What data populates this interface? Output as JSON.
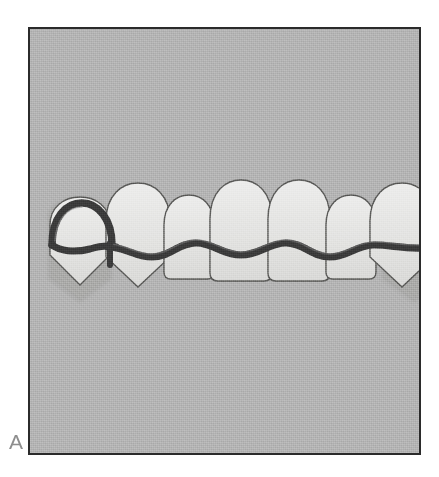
{
  "figure": {
    "label": "A",
    "caption_letter": "A",
    "domain": "dental-illustration"
  },
  "canvas": {
    "width": 439,
    "height": 477,
    "background_color": "#ffffff"
  },
  "panel": {
    "x": 28,
    "y": 27,
    "width": 393,
    "height": 428,
    "fill_color": "#b2b2b2",
    "border_color": "#2b2b2b",
    "border_width": 2
  },
  "colors": {
    "background_gray": "#b2b2b2",
    "panel_border": "#2b2b2b",
    "tooth_fill": "#e2e2e0",
    "tooth_outline": "#4a4a4a",
    "tooth_shadow": "#c7c7c5",
    "wire_dark": "#3a3a3a",
    "wire_highlight": "#6f6f6f",
    "label_gray": "#8e8e8e"
  },
  "illustration": {
    "type": "dental-arch-frontal",
    "tooth_count": 8,
    "arch": "maxillary-anterior",
    "appliance": {
      "name": "hawley-retainer",
      "labial_bow_present": true,
      "labial_bow_color": "#3a3a3a",
      "clasp_count": 2,
      "clasp_positions": [
        "left-canine",
        "right-canine"
      ],
      "clasp_shape": "circumferential-loop"
    },
    "teeth": [
      {
        "index": 1,
        "name": "canine-right",
        "shape": "pointed",
        "cx": 78,
        "top": 213,
        "bottom": 288,
        "half_width": 32,
        "crown_height": 56
      },
      {
        "index": 2,
        "name": "lateral-incisor-right",
        "shape": "pointed",
        "cx": 132,
        "top": 205,
        "bottom": 290,
        "half_width": 31,
        "crown_height": 64
      },
      {
        "index": 3,
        "name": "central-incisor-right",
        "shape": "flat",
        "cx": 182,
        "top": 215,
        "bottom": 281,
        "half_width": 26,
        "crown_height": 52
      },
      {
        "index": 4,
        "name": "central-incisor-mid-r",
        "shape": "flat",
        "cx": 233,
        "top": 206,
        "bottom": 285,
        "half_width": 30,
        "crown_height": 60
      },
      {
        "index": 5,
        "name": "central-incisor-mid-l",
        "shape": "flat",
        "cx": 285,
        "top": 206,
        "bottom": 285,
        "half_width": 30,
        "crown_height": 60
      },
      {
        "index": 6,
        "name": "central-incisor-left",
        "shape": "flat",
        "cx": 334,
        "top": 215,
        "bottom": 281,
        "half_width": 26,
        "crown_height": 52
      },
      {
        "index": 7,
        "name": "lateral-incisor-left",
        "shape": "pointed",
        "cx": 384,
        "top": 205,
        "bottom": 290,
        "half_width": 31,
        "crown_height": 64
      },
      {
        "index": 8,
        "name": "canine-left",
        "shape": "pointed",
        "cx": 438,
        "top": 213,
        "bottom": 288,
        "half_width": 32,
        "crown_height": 56
      }
    ],
    "wire": {
      "description": "labial bow crossing all eight teeth at mid-crown height",
      "y_center": 252,
      "thickness": 7,
      "wave_amplitude": 7
    }
  }
}
